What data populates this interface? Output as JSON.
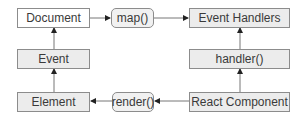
{
  "diagram": {
    "nodes": [
      {
        "id": "document",
        "label": "Document",
        "style": "plain"
      },
      {
        "id": "map",
        "label": "map()",
        "style": "round"
      },
      {
        "id": "event_handlers",
        "label": "Event Handlers",
        "style": "gray"
      },
      {
        "id": "event",
        "label": "Event",
        "style": "gray"
      },
      {
        "id": "handler",
        "label": "handler()",
        "style": "gray"
      },
      {
        "id": "element",
        "label": "Element",
        "style": "gray"
      },
      {
        "id": "render",
        "label": "render()",
        "style": "round"
      },
      {
        "id": "react_component",
        "label": "React Component",
        "style": "gray"
      }
    ],
    "edges": [
      {
        "from": "document",
        "to": "map"
      },
      {
        "from": "map",
        "to": "event_handlers"
      },
      {
        "from": "react_component",
        "to": "handler"
      },
      {
        "from": "handler",
        "to": "event_handlers"
      },
      {
        "from": "react_component",
        "to": "render"
      },
      {
        "from": "render",
        "to": "element"
      },
      {
        "from": "element",
        "to": "event"
      },
      {
        "from": "event",
        "to": "document"
      }
    ],
    "colors": {
      "border": "#8c8c8c",
      "gray_fill": "#ececec",
      "arrow": "#444444",
      "text": "#3a3a3a"
    }
  }
}
